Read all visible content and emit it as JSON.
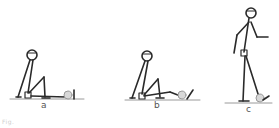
{
  "figure": {
    "panels": [
      {
        "label": "a",
        "pose": "seated, legs extended, foot touching ball"
      },
      {
        "label": "b",
        "pose": "seated, knee bent, foot behind ball"
      },
      {
        "label": "c",
        "pose": "standing, foot on ball"
      }
    ],
    "caption": "Fig.",
    "colors": {
      "stroke": "#2a2a2a",
      "ground": "#9a9a9a",
      "ball": "#d8d8d8",
      "label": "#555555"
    }
  }
}
